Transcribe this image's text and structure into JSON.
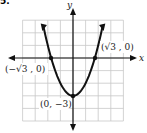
{
  "problem_number": "5.",
  "chart_data": {
    "type": "line",
    "title": "",
    "function": "y = x^2 - 3",
    "xlabel": "x",
    "ylabel": "y",
    "xlim": [
      -4,
      4
    ],
    "ylim": [
      -5,
      3
    ],
    "grid": true,
    "grid_step": 1,
    "points": [
      {
        "label": "(-√3, 0)",
        "x": -1.732,
        "y": 0
      },
      {
        "label": "(√3, 0)",
        "x": 1.732,
        "y": 0
      },
      {
        "label": "(0, -3)",
        "x": 0,
        "y": -3
      }
    ],
    "series": [
      {
        "name": "parabola",
        "x": [
          -2.4,
          -2,
          -1.732,
          -1,
          0,
          1,
          1.732,
          2,
          2.4
        ],
        "y": [
          2.76,
          1,
          0,
          -2,
          -3,
          -2,
          0,
          1,
          2.76
        ]
      }
    ]
  },
  "labels": {
    "x_axis": "x",
    "y_axis": "y",
    "left_root": "(−√3 , 0)",
    "right_root": "(√3 , 0)",
    "vertex": "(0, −3)"
  },
  "colors": {
    "grid": "#c8c8c8",
    "curve": "#111111",
    "axis": "#111111"
  }
}
